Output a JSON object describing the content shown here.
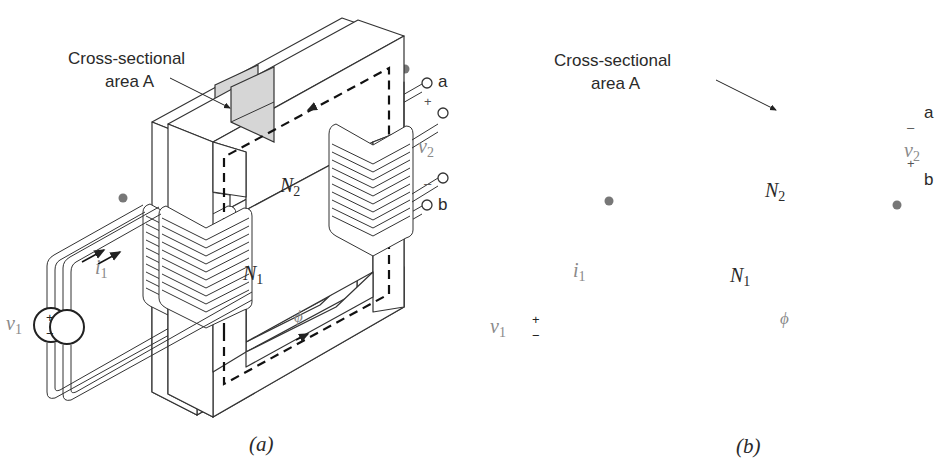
{
  "figure": {
    "panels": [
      {
        "id": "a",
        "caption": "(a)",
        "cross_section_label_line1": "Cross-sectional",
        "cross_section_label_line2": "area A",
        "primary_turns_label": "N",
        "primary_turns_sub": "1",
        "secondary_turns_label": "N",
        "secondary_turns_sub": "2",
        "source_voltage_label": "v",
        "source_voltage_sub": "1",
        "source_plus": "+",
        "source_minus": "−",
        "current_label": "i",
        "current_sub": "1",
        "flux_label": "ϕ",
        "secondary_voltage_label": "v",
        "secondary_voltage_sub": "2",
        "terminal_top": "a",
        "terminal_bottom": "b",
        "terminal_top_polarity": "+",
        "terminal_bottom_polarity": "–",
        "secondary_dot_position": "top"
      },
      {
        "id": "b",
        "caption": "(b)",
        "cross_section_label_line1": "Cross-sectional",
        "cross_section_label_line2": "area A",
        "primary_turns_label": "N",
        "primary_turns_sub": "1",
        "secondary_turns_label": "N",
        "secondary_turns_sub": "2",
        "source_voltage_label": "v",
        "source_voltage_sub": "1",
        "source_plus": "+",
        "source_minus": "−",
        "current_label": "i",
        "current_sub": "1",
        "flux_label": "ϕ",
        "secondary_voltage_label": "v",
        "secondary_voltage_sub": "2",
        "terminal_top": "a",
        "terminal_bottom": "b",
        "terminal_top_polarity": "–",
        "terminal_bottom_polarity": "+",
        "secondary_dot_position": "bottom"
      }
    ],
    "colors": {
      "line": "#333333",
      "cross_section_fill": "#d6d6d6",
      "dot": "#777777",
      "label_gray": "#8a8a8a"
    }
  }
}
